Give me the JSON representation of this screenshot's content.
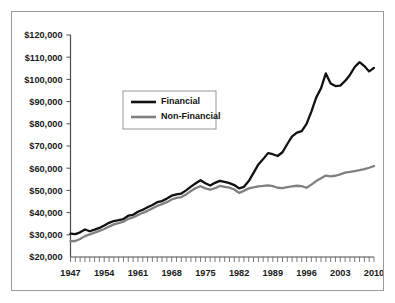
{
  "chart_data": {
    "type": "line",
    "title": "",
    "subtitle": "",
    "xlabel": "",
    "ylabel": "",
    "xlim": [
      1947,
      2010
    ],
    "ylim": [
      20000,
      120000
    ],
    "grid": false,
    "legend_position": "upper-left-inside",
    "y_ticks": [
      20000,
      30000,
      40000,
      50000,
      60000,
      70000,
      80000,
      90000,
      100000,
      110000,
      120000
    ],
    "y_tick_labels": [
      "$20,000",
      "$30,000",
      "$40,000",
      "$50,000",
      "$60,000",
      "$70,000",
      "$80,000",
      "$90,000",
      "$100,000",
      "$110,000",
      "$120,000"
    ],
    "x_ticks": [
      1947,
      1954,
      1961,
      1968,
      1975,
      1982,
      1989,
      1996,
      2003,
      2010
    ],
    "x_tick_labels": [
      "1947",
      "1954",
      "1961",
      "1968",
      "1975",
      "1982",
      "1989",
      "1996",
      "2003",
      "2010"
    ],
    "x_minor_tick_interval": 1,
    "x": [
      1947,
      1948,
      1949,
      1950,
      1951,
      1952,
      1953,
      1954,
      1955,
      1956,
      1957,
      1958,
      1959,
      1960,
      1961,
      1962,
      1963,
      1964,
      1965,
      1966,
      1967,
      1968,
      1969,
      1970,
      1971,
      1972,
      1973,
      1974,
      1975,
      1976,
      1977,
      1978,
      1979,
      1980,
      1981,
      1982,
      1983,
      1984,
      1985,
      1986,
      1987,
      1988,
      1989,
      1990,
      1991,
      1992,
      1993,
      1994,
      1995,
      1996,
      1997,
      1998,
      1999,
      2000,
      2001,
      2002,
      2003,
      2004,
      2005,
      2006,
      2007,
      2008,
      2009,
      2010
    ],
    "series": [
      {
        "name": "Financial",
        "color": "#111111",
        "values": [
          30500,
          30300,
          31100,
          32400,
          31600,
          32300,
          33100,
          34200,
          35400,
          36200,
          36600,
          37100,
          38600,
          39000,
          40400,
          41300,
          42400,
          43400,
          44700,
          45200,
          46300,
          47600,
          48200,
          48600,
          50000,
          51700,
          53200,
          54600,
          53200,
          52200,
          53400,
          54300,
          53800,
          53300,
          52400,
          50900,
          51600,
          54200,
          57900,
          61700,
          64100,
          66800,
          66300,
          65500,
          67200,
          70900,
          74300,
          76000,
          76700,
          80000,
          85500,
          91800,
          96000,
          102700,
          98200,
          97000,
          97200,
          99300,
          102000,
          105600,
          107800,
          106000,
          103600,
          105200
        ]
      },
      {
        "name": "Non-Financial",
        "color": "#808080",
        "values": [
          27100,
          27200,
          28100,
          29400,
          30200,
          31000,
          31800,
          32600,
          33700,
          34700,
          35300,
          35900,
          37200,
          37800,
          38900,
          39900,
          40800,
          41900,
          43000,
          43800,
          44700,
          45900,
          46600,
          47000,
          48200,
          49700,
          51100,
          51900,
          50900,
          50300,
          51000,
          52000,
          51600,
          51200,
          50400,
          48900,
          49800,
          50900,
          51400,
          51800,
          52000,
          52300,
          51900,
          51200,
          51000,
          51500,
          51800,
          52100,
          51900,
          51200,
          52600,
          54200,
          55500,
          56700,
          56300,
          56600,
          57200,
          58000,
          58300,
          58700,
          59100,
          59600,
          60200,
          61000
        ]
      }
    ]
  },
  "legend": {
    "entries": [
      {
        "label": "Financial",
        "swatch_color": "#111111"
      },
      {
        "label": "Non-Financial",
        "swatch_color": "#808080"
      }
    ]
  },
  "figure": {
    "border_color": "#9a9a9a",
    "background": "#ffffff",
    "axis_color": "#4d4d4d"
  }
}
